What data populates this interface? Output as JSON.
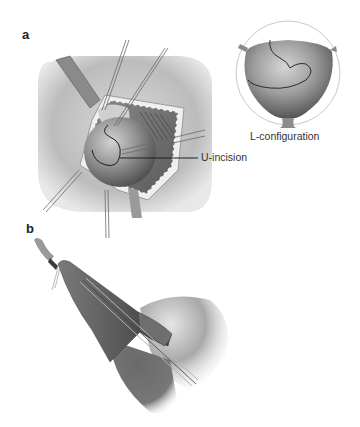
{
  "figure": {
    "panels": [
      {
        "label": "a",
        "description": "Open surgical field with retracted wound edges exposing a spherical organ; U-shaped incision drawn on surface",
        "callout": "U-incision",
        "inset": {
          "caption": "L-configuration",
          "description": "Circular inset showing organ with L-shaped incision line"
        }
      },
      {
        "label": "b",
        "description": "Elongated tubular structure with inserted instrument/catheter lines entering a rounded organ"
      }
    ]
  },
  "colors": {
    "background": "#ffffff",
    "skin": "#c8c8c8",
    "organ_light": "#bdbdbd",
    "organ_dark": "#5a5a5a",
    "line": "#1e1e1e",
    "inset_ring": "#c9c9c9"
  }
}
